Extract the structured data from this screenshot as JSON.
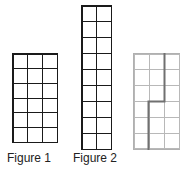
{
  "figures": [
    {
      "label": "Figure 1",
      "columns": 3,
      "rows": 6,
      "style": "dark"
    },
    {
      "label": "Figure 2",
      "columns": 2,
      "rows": 9,
      "style": "dark"
    },
    {
      "label": "",
      "columns": 3,
      "rows": 6,
      "style": "light",
      "highlight_path": "step boundary dividing grid"
    }
  ],
  "colors": {
    "dark_grid": "#1a1a1a",
    "light_grid": "#b8b8b8",
    "path": "#707070"
  }
}
